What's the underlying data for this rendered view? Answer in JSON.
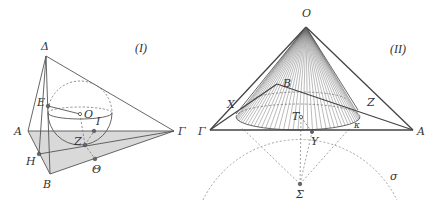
{
  "figure_1": {
    "caption": "(I)",
    "labels": {
      "Delta": "Δ",
      "A": "A",
      "Gamma": "Γ",
      "B": "B",
      "H": "H",
      "E": "E",
      "O": "O",
      "I": "I",
      "Z": "Z",
      "Theta": "Θ"
    },
    "colors": {
      "base_fill": "#d9d9d9",
      "line": "#555555"
    }
  },
  "figure_2": {
    "caption": "(II)",
    "labels": {
      "O": "O",
      "Gamma": "Γ",
      "A": "A",
      "B": "B",
      "X": "X",
      "Z": "Z",
      "T": "T",
      "Y": "Y",
      "Sigma": "Σ",
      "kappa": "κ",
      "sigma": "σ"
    },
    "colors": {
      "generator_lines": "#666666",
      "dashed": "#9a9a9a"
    }
  }
}
